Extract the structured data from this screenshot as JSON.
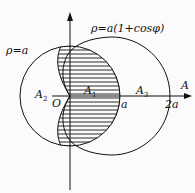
{
  "diagram": {
    "curves": {
      "circle_label": "ρ=a",
      "cardioid_label": "ρ=a(1+cosφ)"
    },
    "regions": {
      "a1": {
        "letter": "A",
        "sub": "1"
      },
      "a2": {
        "letter": "A",
        "sub": "2"
      },
      "a3": {
        "letter": "A",
        "sub": "3"
      }
    },
    "axis": {
      "origin": "O",
      "tick_a": "a",
      "tick_2a": "2a",
      "axis_end": "A"
    },
    "colors": {
      "stroke": "#111111",
      "background": "#fbfbfb"
    }
  }
}
